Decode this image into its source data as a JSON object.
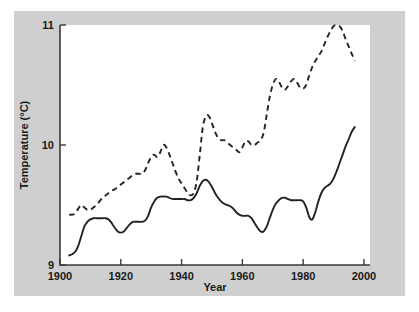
{
  "figure": {
    "background_color": "#cfcfcf",
    "plot_background_color": "#ffffff",
    "line_color": "#232323"
  },
  "axes": {
    "x_title": "Year",
    "y_title": "Temperature (°C)",
    "x_ticks": [
      "1900",
      "1920",
      "1940",
      "1960",
      "1980",
      "2000"
    ],
    "y_ticks": [
      "9",
      "10",
      "11"
    ]
  },
  "chart_data": {
    "type": "line",
    "title": "",
    "subtitle": "",
    "xlabel": "Year",
    "ylabel": "Temperature (°C)",
    "xlim": [
      1900,
      2002
    ],
    "ylim": [
      9,
      11
    ],
    "xticks": [
      1900,
      1920,
      1940,
      1960,
      1980,
      2000
    ],
    "yticks": [
      9,
      10,
      11
    ],
    "grid": false,
    "legend": "none",
    "annotations": [],
    "series": [
      {
        "name": "solid-line",
        "style": "solid",
        "color": "#232323",
        "x": [
          1903,
          1904,
          1905,
          1906,
          1907,
          1908,
          1909,
          1910,
          1911,
          1912,
          1913,
          1914,
          1915,
          1916,
          1917,
          1918,
          1919,
          1920,
          1921,
          1922,
          1923,
          1924,
          1925,
          1926,
          1927,
          1928,
          1929,
          1930,
          1931,
          1932,
          1933,
          1934,
          1935,
          1936,
          1937,
          1938,
          1939,
          1940,
          1941,
          1942,
          1943,
          1944,
          1945,
          1946,
          1947,
          1948,
          1949,
          1950,
          1951,
          1952,
          1953,
          1954,
          1955,
          1956,
          1957,
          1958,
          1959,
          1960,
          1961,
          1962,
          1963,
          1964,
          1965,
          1966,
          1967,
          1968,
          1969,
          1970,
          1971,
          1972,
          1973,
          1974,
          1975,
          1976,
          1977,
          1978,
          1979,
          1980,
          1981,
          1982,
          1983,
          1984,
          1985,
          1986,
          1987,
          1988,
          1989,
          1990,
          1991,
          1992,
          1993,
          1994,
          1995,
          1996,
          1997
        ],
        "y": [
          9.08,
          9.09,
          9.11,
          9.16,
          9.24,
          9.32,
          9.36,
          9.38,
          9.39,
          9.39,
          9.39,
          9.39,
          9.39,
          9.38,
          9.35,
          9.31,
          9.28,
          9.27,
          9.28,
          9.31,
          9.34,
          9.36,
          9.36,
          9.36,
          9.36,
          9.37,
          9.41,
          9.48,
          9.53,
          9.56,
          9.57,
          9.57,
          9.57,
          9.56,
          9.55,
          9.55,
          9.55,
          9.55,
          9.55,
          9.54,
          9.54,
          9.56,
          9.6,
          9.66,
          9.7,
          9.71,
          9.69,
          9.65,
          9.6,
          9.56,
          9.53,
          9.51,
          9.5,
          9.49,
          9.47,
          9.44,
          9.42,
          9.41,
          9.41,
          9.41,
          9.39,
          9.35,
          9.31,
          9.28,
          9.28,
          9.32,
          9.39,
          9.46,
          9.51,
          9.54,
          9.56,
          9.56,
          9.55,
          9.54,
          9.54,
          9.54,
          9.54,
          9.53,
          9.48,
          9.4,
          9.38,
          9.44,
          9.53,
          9.6,
          9.64,
          9.66,
          9.68,
          9.72,
          9.78,
          9.85,
          9.92,
          9.99,
          10.05,
          10.11,
          10.15
        ]
      },
      {
        "name": "dashed-line",
        "style": "dashed",
        "color": "#232323",
        "x": [
          1903,
          1904,
          1905,
          1906,
          1907,
          1908,
          1909,
          1910,
          1911,
          1912,
          1913,
          1914,
          1915,
          1916,
          1917,
          1918,
          1919,
          1920,
          1921,
          1922,
          1923,
          1924,
          1925,
          1926,
          1927,
          1928,
          1929,
          1930,
          1931,
          1932,
          1933,
          1934,
          1935,
          1936,
          1937,
          1938,
          1939,
          1940,
          1941,
          1942,
          1943,
          1944,
          1945,
          1946,
          1947,
          1948,
          1949,
          1950,
          1951,
          1952,
          1953,
          1954,
          1955,
          1956,
          1957,
          1958,
          1959,
          1960,
          1961,
          1962,
          1963,
          1964,
          1965,
          1966,
          1967,
          1968,
          1969,
          1970,
          1971,
          1972,
          1973,
          1974,
          1975,
          1976,
          1977,
          1978,
          1979,
          1980,
          1981,
          1982,
          1983,
          1984,
          1985,
          1986,
          1987,
          1988,
          1989,
          1990,
          1991,
          1992,
          1993,
          1994,
          1995,
          1996,
          1997
        ],
        "y": [
          9.42,
          9.42,
          9.43,
          9.47,
          9.5,
          9.48,
          9.46,
          9.46,
          9.48,
          9.5,
          9.53,
          9.56,
          9.58,
          9.6,
          9.62,
          9.63,
          9.65,
          9.67,
          9.69,
          9.71,
          9.73,
          9.75,
          9.76,
          9.76,
          9.76,
          9.79,
          9.85,
          9.9,
          9.92,
          9.9,
          9.94,
          10.0,
          9.98,
          9.92,
          9.85,
          9.78,
          9.72,
          9.68,
          9.64,
          9.6,
          9.58,
          9.6,
          9.7,
          9.92,
          10.15,
          10.24,
          10.24,
          10.18,
          10.11,
          10.06,
          10.04,
          10.04,
          10.02,
          10.0,
          9.98,
          9.96,
          9.94,
          9.98,
          10.03,
          10.03,
          10.0,
          10.0,
          10.02,
          10.04,
          10.1,
          10.25,
          10.4,
          10.5,
          10.55,
          10.53,
          10.48,
          10.46,
          10.49,
          10.53,
          10.55,
          10.52,
          10.48,
          10.47,
          10.5,
          10.58,
          10.65,
          10.7,
          10.74,
          10.78,
          10.84,
          10.9,
          10.95,
          10.99,
          11.0,
          10.99,
          10.95,
          10.88,
          10.82,
          10.76,
          10.7
        ]
      }
    ]
  }
}
